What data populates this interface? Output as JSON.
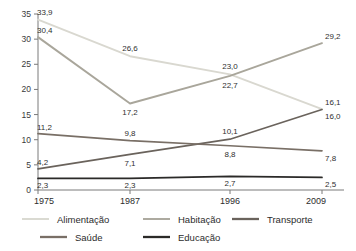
{
  "chart_data": {
    "type": "line",
    "title": "",
    "subtitle": "",
    "xlabel": "",
    "ylabel": "",
    "categories": [
      "1975",
      "1987",
      "1996",
      "2009"
    ],
    "ylim": [
      0,
      35
    ],
    "yticks": [
      "0",
      "5",
      "10",
      "15",
      "20",
      "25",
      "30",
      "35"
    ],
    "grid": false,
    "legend_position": "bottom",
    "series": [
      {
        "name": "Alimentação",
        "color": "#d9d8d0",
        "values": [
          33.9,
          26.6,
          23.0,
          16.1
        ],
        "labels": [
          "33,9",
          "26,6",
          "23,0",
          "16,1"
        ]
      },
      {
        "name": "Habitação",
        "color": "#a9a69b",
        "values": [
          30.4,
          17.2,
          22.7,
          29.2
        ],
        "labels": [
          "30,4",
          "17,2",
          "22,7",
          "29,2"
        ]
      },
      {
        "name": "Transporte",
        "color": "#6a635c",
        "values": [
          4.2,
          7.1,
          10.1,
          16.0
        ],
        "labels": [
          "4,2",
          "7,1",
          "10,1",
          "16,0"
        ]
      },
      {
        "name": "Saúde",
        "color": "#796f66",
        "values": [
          11.2,
          9.8,
          8.8,
          7.8
        ],
        "labels": [
          "11,2",
          "9,8",
          "8,8",
          "7,8"
        ]
      },
      {
        "name": "Educação",
        "color": "#2b2a28",
        "values": [
          2.3,
          2.3,
          2.7,
          2.5
        ],
        "labels": [
          "2,3",
          "2,3",
          "2,7",
          "2,5"
        ]
      }
    ],
    "legend": [
      {
        "label": "Alimentação",
        "color": "#d9d8d0"
      },
      {
        "label": "Habitação",
        "color": "#a9a69b"
      },
      {
        "label": "Transporte",
        "color": "#6a635c"
      },
      {
        "label": "Saúde",
        "color": "#796f66"
      },
      {
        "label": "Educação",
        "color": "#2b2a28"
      }
    ]
  }
}
